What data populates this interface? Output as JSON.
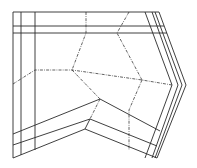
{
  "diagram": {
    "type": "line-drawing",
    "colors": {
      "background": "#ffffff",
      "line": "#2a2a2a"
    },
    "outer_outline": [
      [
        13,
        12
      ],
      [
        159,
        12
      ],
      [
        186,
        85
      ],
      [
        157,
        158
      ],
      [
        85,
        129
      ],
      [
        13,
        158
      ]
    ],
    "solid_lines": [
      [
        [
          21,
          12
        ],
        [
          21,
          155
        ]
      ],
      [
        [
          35,
          12
        ],
        [
          35,
          150
        ]
      ],
      [
        [
          13,
          26
        ],
        [
          164,
          26
        ]
      ],
      [
        [
          13,
          33
        ],
        [
          167,
          33
        ]
      ],
      [
        [
          145,
          12
        ],
        [
          172,
          85
        ],
        [
          145,
          158
        ]
      ],
      [
        [
          152,
          12
        ],
        [
          178,
          85
        ],
        [
          152,
          158
        ]
      ],
      [
        [
          155,
          12
        ],
        [
          182,
          85
        ],
        [
          155,
          158
        ]
      ],
      [
        [
          13,
          134
        ],
        [
          100,
          99
        ],
        [
          160,
          131
        ]
      ],
      [
        [
          13,
          145
        ],
        [
          90,
          119
        ],
        [
          157,
          146
        ]
      ],
      [
        [
          90,
          119
        ],
        [
          85,
          129
        ]
      ]
    ],
    "dashed_lines": [
      [
        [
          86,
          12
        ],
        [
          86,
          33
        ],
        [
          72,
          70
        ]
      ],
      [
        [
          129,
          12
        ],
        [
          117,
          33
        ],
        [
          142,
          80
        ]
      ],
      [
        [
          13,
          84
        ],
        [
          35,
          70
        ],
        [
          72,
          70
        ],
        [
          142,
          80
        ],
        [
          172,
          85
        ]
      ],
      [
        [
          72,
          70
        ],
        [
          100,
          99
        ]
      ],
      [
        [
          142,
          80
        ],
        [
          129,
          110
        ],
        [
          129,
          150
        ]
      ],
      [
        [
          100,
          99
        ],
        [
          90,
          119
        ]
      ]
    ]
  }
}
